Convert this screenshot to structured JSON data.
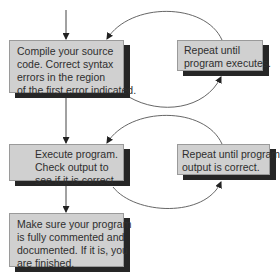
{
  "diagram": {
    "type": "flowchart",
    "colors": {
      "box_fill": "#d0d0d0",
      "box_shadow": "#262626",
      "line": "#555555",
      "text": "#2e2e2e"
    },
    "boxes": [
      {
        "id": "compile",
        "lines": [
          "Compile your source",
          "code. Correct syntax",
          "errors in the region",
          "of the first error indicated."
        ]
      },
      {
        "id": "repeat-compile",
        "lines": [
          "Repeat until",
          "program executes."
        ]
      },
      {
        "id": "execute",
        "lines": [
          "Execute program.",
          "Check output to",
          "see if it is correct."
        ]
      },
      {
        "id": "repeat-execute",
        "lines": [
          "Repeat until program",
          "output is correct."
        ]
      },
      {
        "id": "finish",
        "lines": [
          "Make sure your program",
          "is fully commented and",
          "documented. If it is, you",
          "are finished."
        ]
      }
    ],
    "edges": [
      {
        "from": "start",
        "to": "compile"
      },
      {
        "from": "compile",
        "to": "repeat-compile",
        "style": "curved"
      },
      {
        "from": "repeat-compile",
        "to": "compile",
        "style": "curved"
      },
      {
        "from": "compile",
        "to": "execute"
      },
      {
        "from": "execute",
        "to": "repeat-execute",
        "style": "curved"
      },
      {
        "from": "repeat-execute",
        "to": "execute",
        "style": "curved"
      },
      {
        "from": "execute",
        "to": "finish"
      }
    ]
  }
}
